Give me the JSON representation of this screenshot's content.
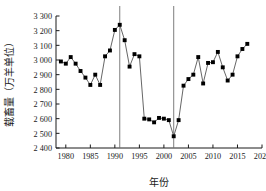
{
  "chart_data": {
    "type": "line",
    "title": "",
    "subtitle": "",
    "xlabel": "年份",
    "ylabel": "载畜量（万羊单位）",
    "xlim": [
      1978,
      2020
    ],
    "ylim": [
      2400,
      3300
    ],
    "xticks": [
      1980,
      1985,
      1990,
      1995,
      2000,
      2005,
      2010,
      2015,
      2020
    ],
    "xticklabels": [
      "1980",
      "1985",
      "1990",
      "1995",
      "2000",
      "2005",
      "2010",
      "2015",
      "2020"
    ],
    "yticks": [
      2400,
      2500,
      2600,
      2700,
      2800,
      2900,
      3000,
      3100,
      3200,
      3300
    ],
    "yticklabels": [
      "2 400",
      "2 500",
      "2 600",
      "2 700",
      "2 800",
      "2 900",
      "3 000",
      "3 100",
      "3 200",
      "3 300"
    ],
    "grid": false,
    "legend": null,
    "marker": "square",
    "marker_color": "#000000",
    "line_color": "#555555",
    "series": [
      {
        "name": "载畜量",
        "x": [
          1979,
          1980,
          1981,
          1982,
          1983,
          1984,
          1985,
          1986,
          1987,
          1988,
          1989,
          1990,
          1991,
          1992,
          1993,
          1994,
          1995,
          1996,
          1997,
          1998,
          1999,
          2000,
          2001,
          2002,
          2003,
          2004,
          2005,
          2006,
          2007,
          2008,
          2009,
          2010,
          2011,
          2012,
          2013,
          2014,
          2015,
          2016,
          2017
        ],
        "values": [
          2990,
          2975,
          3020,
          2975,
          2925,
          2880,
          2830,
          2900,
          2830,
          3025,
          3065,
          3205,
          3240,
          3135,
          2955,
          3040,
          3025,
          2600,
          2595,
          2575,
          2605,
          2600,
          2590,
          2480,
          2590,
          2825,
          2870,
          2900,
          3020,
          2840,
          2980,
          2985,
          3055,
          2950,
          2860,
          2900,
          3025,
          3075,
          3110
        ]
      }
    ],
    "annotations": [
      {
        "type": "vline",
        "x": 1991,
        "color": "#6f6f6f"
      },
      {
        "type": "vline",
        "x": 2002,
        "color": "#6f6f6f"
      }
    ]
  },
  "axes": {
    "y_axis_label": "载畜量（万羊单位）",
    "x_axis_label": "年份"
  }
}
